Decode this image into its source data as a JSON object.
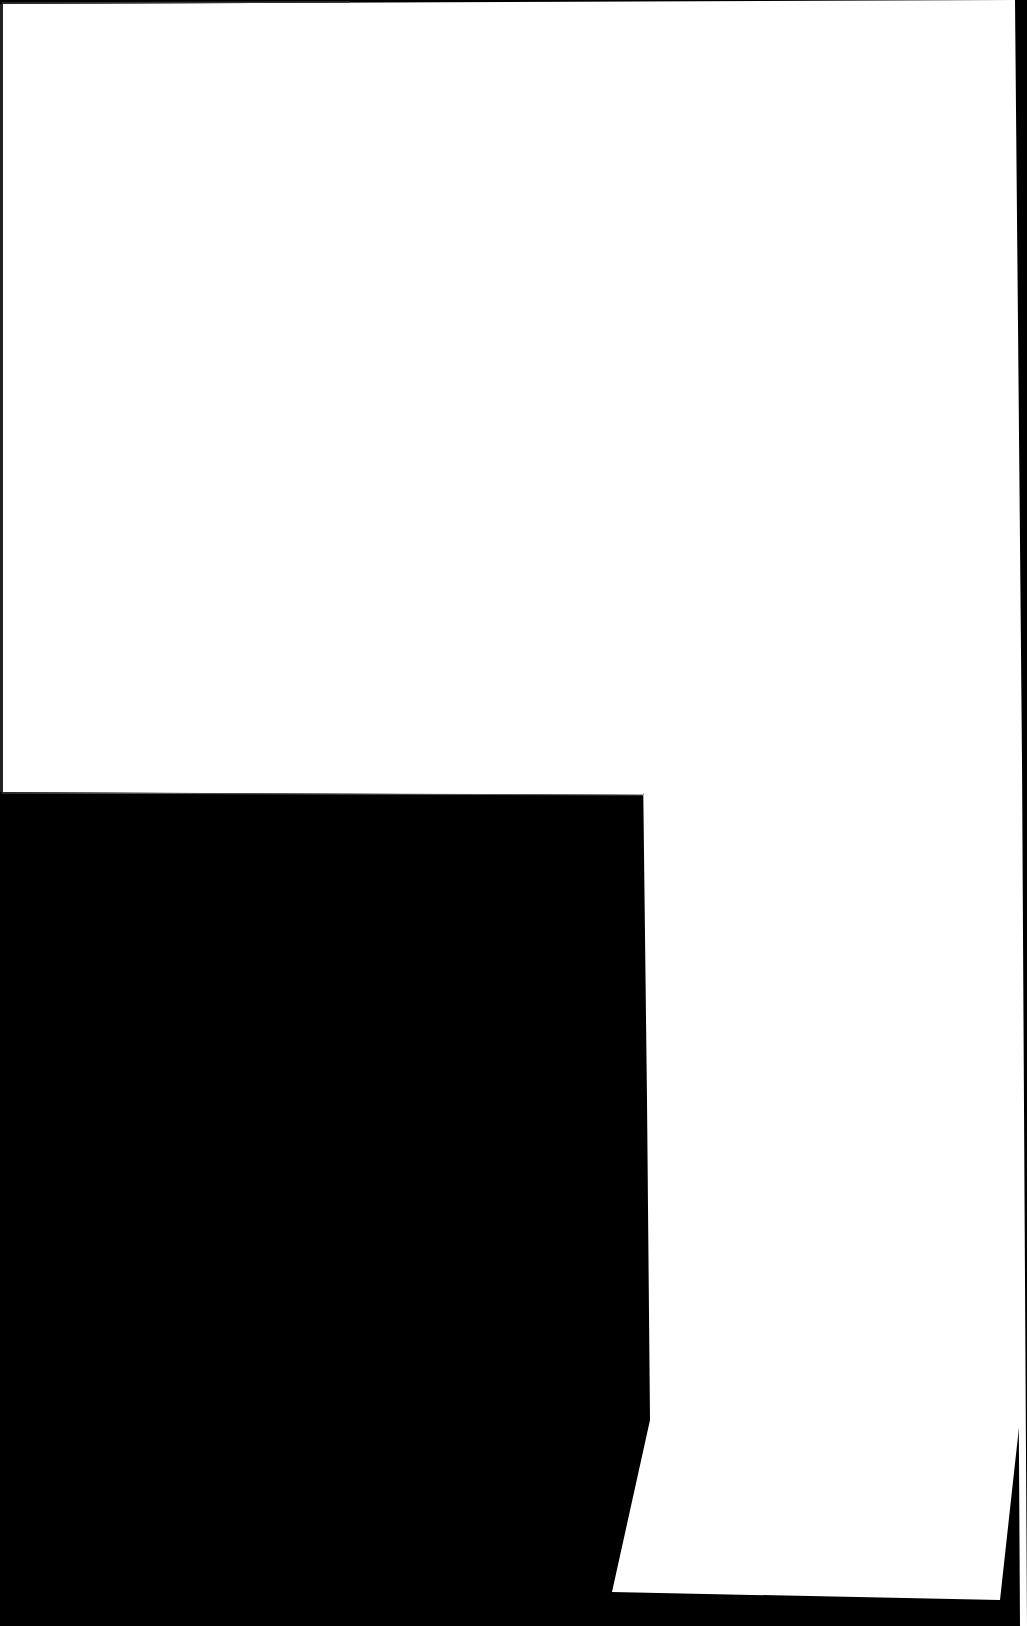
{
  "scene": {
    "description": "Scanned blank white paper sheets on black background",
    "colors": {
      "background": "#000000",
      "paper": "#ffffff",
      "edge": "#1a1a1a"
    },
    "width": 1027,
    "height": 1626
  }
}
